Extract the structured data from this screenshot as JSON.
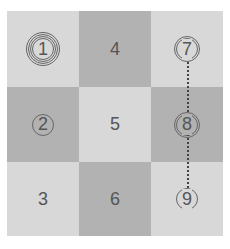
{
  "grid": {
    "cells": [
      {
        "label": "1",
        "pos": "row1-col1",
        "shade": "light",
        "style": "multi-ring"
      },
      {
        "label": "4",
        "pos": "row1-col2",
        "shade": "dark",
        "style": "plain"
      },
      {
        "label": "7",
        "pos": "row1-col3",
        "shade": "light",
        "style": "double-ring"
      },
      {
        "label": "2",
        "pos": "row2-col1",
        "shade": "dark",
        "style": "single-ring"
      },
      {
        "label": "5",
        "pos": "row2-col2",
        "shade": "light",
        "style": "plain"
      },
      {
        "label": "8",
        "pos": "row2-col3",
        "shade": "dark",
        "style": "double-ring"
      },
      {
        "label": "3",
        "pos": "row3-col1",
        "shade": "light",
        "style": "plain"
      },
      {
        "label": "6",
        "pos": "row3-col2",
        "shade": "dark",
        "style": "plain"
      },
      {
        "label": "9",
        "pos": "row3-col3",
        "shade": "light",
        "style": "single-ring"
      }
    ]
  },
  "colors": {
    "light": "#d8d8d8",
    "dark": "#b2b2b2",
    "text": "#555555"
  },
  "connector": {
    "from": "7",
    "to": "9",
    "style": "dotted"
  }
}
